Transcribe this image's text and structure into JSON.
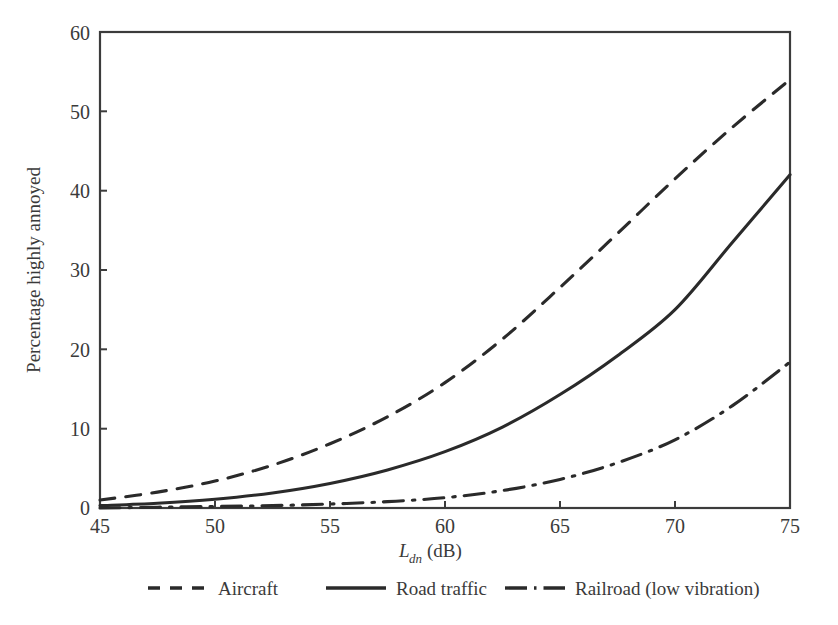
{
  "chart_data": {
    "type": "line",
    "title": "",
    "xlabel": "L_dn (dB)",
    "xlabel_main": "L",
    "xlabel_sub": "dn",
    "xlabel_unit": " (dB)",
    "ylabel": "Percentage highly annoyed",
    "xlim": [
      45,
      75
    ],
    "ylim": [
      0,
      60
    ],
    "xticks": [
      45,
      50,
      55,
      60,
      65,
      70,
      75
    ],
    "yticks": [
      0,
      10,
      20,
      30,
      40,
      50,
      60
    ],
    "grid": false,
    "legend_position": "below-center",
    "x": [
      45,
      47.5,
      50,
      52.5,
      55,
      57.5,
      60,
      62.5,
      65,
      67.5,
      70,
      72.5,
      75
    ],
    "series": [
      {
        "name": "Aircraft",
        "style": "dashed",
        "color": "#2a2a2a",
        "values": [
          1.0,
          2.0,
          3.4,
          5.4,
          8.1,
          11.5,
          15.8,
          21.3,
          27.8,
          34.6,
          41.5,
          48.0,
          54.0
        ]
      },
      {
        "name": "Road traffic",
        "style": "solid",
        "color": "#2a2a2a",
        "values": [
          0.3,
          0.6,
          1.1,
          1.9,
          3.1,
          4.8,
          7.1,
          10.2,
          14.3,
          19.2,
          25.0,
          33.5,
          42.0
        ]
      },
      {
        "name": "Railroad (low vibration)",
        "style": "dashdot",
        "color": "#2a2a2a",
        "values": [
          0.0,
          0.1,
          0.2,
          0.3,
          0.5,
          0.8,
          1.3,
          2.2,
          3.6,
          5.7,
          8.6,
          12.9,
          18.4
        ]
      }
    ]
  },
  "legend": {
    "items": [
      {
        "label": "Aircraft",
        "style": "dashed"
      },
      {
        "label": "Road traffic",
        "style": "solid"
      },
      {
        "label": "Railroad (low vibration)",
        "style": "dashdot"
      }
    ]
  },
  "axes": {
    "y_title": "Percentage highly annoyed",
    "x_title_base": "L",
    "x_title_sub": "dn",
    "x_title_unit": "(dB)",
    "x_tick_labels": [
      "45",
      "50",
      "55",
      "60",
      "65",
      "70",
      "75"
    ],
    "y_tick_labels": [
      "0",
      "10",
      "20",
      "30",
      "40",
      "50",
      "60"
    ]
  },
  "colors": {
    "background": "#ffffff",
    "line": "#2a2a2a",
    "frame": "#3c3c3c",
    "text": "#3a3a3a"
  }
}
